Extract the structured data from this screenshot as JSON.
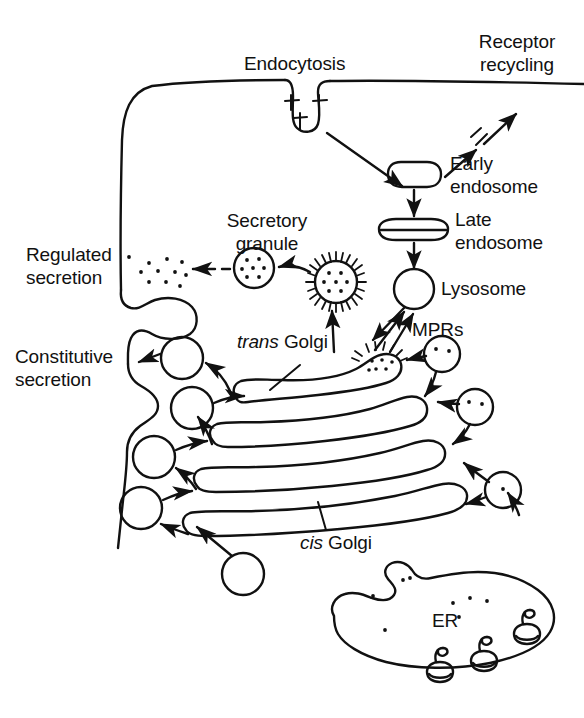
{
  "figure": {
    "width": 584,
    "height": 718,
    "background_color": "#ffffff",
    "stroke_color": "#111111"
  },
  "labels": {
    "endocytosis": "Endocytosis",
    "receptor_recycling_line1": "Receptor",
    "receptor_recycling_line2": "recycling",
    "early_endosome_line1": "Early",
    "early_endosome_line2": "endosome",
    "late_endosome_line1": "Late",
    "late_endosome_line2": "endosome",
    "lysosome": "Lysosome",
    "mprs": "MPRs",
    "secretory_granule_line1": "Secretory",
    "secretory_granule_line2": "granule",
    "regulated_secretion_line1": "Regulated",
    "regulated_secretion_line2": "secretion",
    "constitutive_secretion_line1": "Constitutive",
    "constitutive_secretion_line2": "secretion",
    "trans_golgi_italic": "trans",
    "trans_golgi_rest": " Golgi",
    "cis_golgi_italic": "cis",
    "cis_golgi_rest": " Golgi",
    "er": "ER"
  },
  "organelles": [
    {
      "name": "plasma-membrane",
      "label": null,
      "shape": "membrane-outline"
    },
    {
      "name": "coated-pit",
      "label": "Endocytosis",
      "shape": "invagination-with-receptors"
    },
    {
      "name": "early-endosome",
      "label": "Early endosome",
      "shape": "rounded-rect"
    },
    {
      "name": "late-endosome",
      "label": "Late endosome",
      "shape": "flattened-oval"
    },
    {
      "name": "lysosome",
      "label": "Lysosome",
      "shape": "circle"
    },
    {
      "name": "secretory-granule",
      "label": "Secretory granule",
      "shape": "dotted-circle"
    },
    {
      "name": "clathrin-coated-vesicle",
      "label": null,
      "shape": "spiked-dotted-circle"
    },
    {
      "name": "trans-golgi-cisterna",
      "label": "trans Golgi",
      "shape": "cisterna"
    },
    {
      "name": "golgi-cisterna-2",
      "label": null,
      "shape": "cisterna"
    },
    {
      "name": "golgi-cisterna-3",
      "label": null,
      "shape": "cisterna"
    },
    {
      "name": "cis-golgi-cisterna",
      "label": "cis Golgi",
      "shape": "cisterna"
    },
    {
      "name": "endoplasmic-reticulum",
      "label": "ER",
      "shape": "lobed-blob-with-ribosomes"
    },
    {
      "name": "regulated-secretion-site",
      "label": "Regulated secretion",
      "shape": "exocytosis-pocket"
    },
    {
      "name": "constitutive-secretion-site",
      "label": "Constitutive secretion",
      "shape": "membrane-fold"
    }
  ],
  "transport_vesicles": {
    "empty_count": 5,
    "mpr_count": 3,
    "description": "Empty circles carry constitutive cargo toward plasma membrane; dotted circles are MPR-bearing vesicles"
  },
  "ribosomes": {
    "count": 3,
    "location": "endoplasmic-reticulum-membrane"
  },
  "arrows": {
    "endocytosis_to_early_endosome": "solid",
    "early_endosome_to_membrane": "solid",
    "early_endosome_to_late_endosome": "solid",
    "late_endosome_to_lysosome": "solid",
    "lysosome_to_trans_golgi": "solid-bidirectional",
    "secretory_granule_to_membrane": "dashed",
    "golgi_to_secretory_granule": "solid",
    "er_to_cis_golgi": "solid",
    "cisterna_to_cisterna": "solid"
  }
}
